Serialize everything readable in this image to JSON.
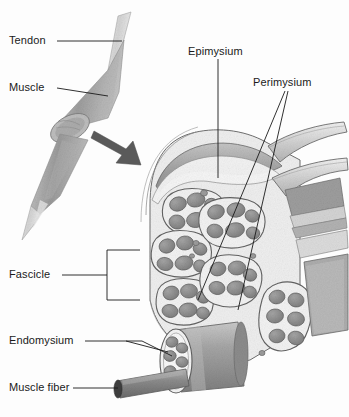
{
  "figure": {
    "background_color": "#fdfdfd",
    "ink_color": "#1a1a1a",
    "style": "grayscale pencil/airbrush anatomical illustration"
  },
  "labels": {
    "tendon": "Tendon",
    "muscle": "Muscle",
    "epimysium": "Epimysium",
    "perimysium": "Perimysium",
    "fascicle": "Fascicle",
    "endomysium": "Endomysium",
    "muscle_fiber": "Muscle fiber"
  },
  "colors": {
    "tissue_light": "#d8d8d8",
    "tissue_mid": "#b0b0b0",
    "tissue_dark": "#8a8a8a",
    "fiber_fill": "#8f8f8f",
    "fiber_dark": "#6e6e6e",
    "sheath_white": "#f4f4f4",
    "arrow": "#555555",
    "leader": "#1a1a1a"
  },
  "parts": {
    "whole_muscle_view": {
      "name": "whole muscle with tendons",
      "description": "spindle-shaped muscle belly with tapering tendons at both ends, cut transversely at mid-belly"
    },
    "cut_face": {
      "name": "transverse cut face",
      "description": "elliptical cut surface on the muscle belly"
    },
    "magnify_arrow": {
      "name": "magnification arrow",
      "description": "bent dark gray arrow pointing from the cut face to the enlarged cross-section"
    },
    "cross_section": {
      "name": "enlarged muscle cross-section",
      "description": "cut muscle showing epimysium sheath, fascicles wrapped in perimysium, each containing muscle fibers"
    },
    "peeled_sheets": {
      "name": "peeled epimysium sheets",
      "description": "two connective tissue sheets peeled back to the right"
    },
    "fascicle_cylinder": {
      "name": "isolated fascicle",
      "description": "pulled-out cylindrical fascicle showing muscle fibers within endomysium"
    },
    "fiber_rod": {
      "name": "isolated muscle fiber",
      "description": "single cylindrical muscle fiber drawn out to the lower left"
    }
  },
  "leaders": {
    "tendon": "horizontal line from label to tendon tip",
    "muscle": "horizontal line from label to muscle belly",
    "epimysium": "vertical line from label down to outer sheath",
    "perimysium": "two diverging lines down-left into fascicle boundaries",
    "fascicle": "horizontal line to a vertical bracket spanning fascicle region",
    "endomysium": "line branching to two fibers inside the isolated fascicle",
    "muscle_fiber": "horizontal line to the isolated fiber rod"
  }
}
